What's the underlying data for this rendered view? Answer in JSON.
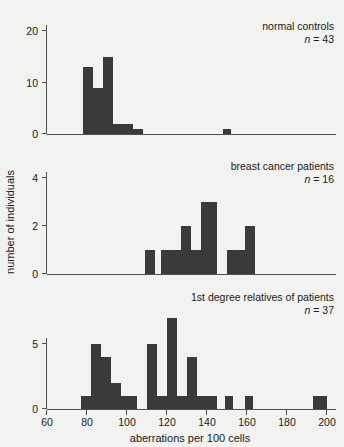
{
  "figure": {
    "background_color": "#f2f2f0",
    "bar_color": "#3a3a3a",
    "axis_color": "#4d4d4d"
  },
  "axis": {
    "xlabel": "aberrations per 100 cells",
    "ylabel": "number of individuals",
    "x_ticks": [
      "60",
      "80",
      "100",
      "120",
      "140",
      "160",
      "180",
      "200"
    ],
    "x_tick_values": [
      60,
      80,
      100,
      120,
      140,
      160,
      180,
      200
    ],
    "xlim": [
      57,
      203
    ]
  },
  "panels": [
    {
      "id": "normal-controls",
      "title": "normal controls",
      "n_label": "n = 43",
      "n_symbol": "n",
      "n_value": "= 43",
      "y_ticks": [
        "0",
        "10",
        "20"
      ],
      "y_tick_values": [
        0,
        10,
        20
      ],
      "ylim": [
        0,
        21
      ]
    },
    {
      "id": "breast-cancer-patients",
      "title": "breast cancer patients",
      "n_label": "n = 16",
      "n_symbol": "n",
      "n_value": "= 16",
      "y_ticks": [
        "0",
        "2",
        "4"
      ],
      "y_tick_values": [
        0,
        2,
        4
      ],
      "ylim": [
        0,
        4.6
      ]
    },
    {
      "id": "first-degree-relatives",
      "title": "1st degree relatives of patients",
      "n_label": "n = 37",
      "n_symbol": "n",
      "n_value": "= 37",
      "y_ticks": [
        "0",
        "5"
      ],
      "y_tick_values": [
        0,
        5
      ],
      "ylim": [
        0,
        7.3
      ]
    }
  ],
  "chart_data": [
    {
      "type": "bar",
      "title": "normal controls",
      "subtitle": "n = 43",
      "xlabel": "aberrations per 100 cells",
      "ylabel": "number of individuals",
      "bin_width": 5,
      "xlim": [
        57,
        203
      ],
      "ylim": [
        0,
        21
      ],
      "grid": false,
      "bins": [
        78,
        83,
        88,
        93,
        98,
        103,
        108,
        148
      ],
      "values": [
        13,
        9,
        15,
        2,
        2,
        1,
        0,
        1
      ],
      "bars": [
        {
          "x0": 78,
          "x1": 83,
          "height": 13
        },
        {
          "x0": 83,
          "x1": 88,
          "height": 9
        },
        {
          "x0": 88,
          "x1": 93,
          "height": 15
        },
        {
          "x0": 93,
          "x1": 98,
          "height": 2
        },
        {
          "x0": 98,
          "x1": 103,
          "height": 2
        },
        {
          "x0": 103,
          "x1": 108,
          "height": 1
        },
        {
          "x0": 148,
          "x1": 152,
          "height": 1
        }
      ]
    },
    {
      "type": "bar",
      "title": "breast cancer patients",
      "subtitle": "n = 16",
      "xlabel": "aberrations per 100 cells",
      "ylabel": "number of individuals",
      "bin_width": 5,
      "xlim": [
        57,
        203
      ],
      "ylim": [
        0,
        4.6
      ],
      "grid": false,
      "bars": [
        {
          "x0": 109,
          "x1": 114,
          "height": 1
        },
        {
          "x0": 117,
          "x1": 122,
          "height": 1
        },
        {
          "x0": 122,
          "x1": 127,
          "height": 1
        },
        {
          "x0": 127,
          "x1": 132,
          "height": 2
        },
        {
          "x0": 132,
          "x1": 137,
          "height": 1
        },
        {
          "x0": 137,
          "x1": 145,
          "height": 3
        },
        {
          "x0": 150,
          "x1": 159,
          "height": 1
        },
        {
          "x0": 159,
          "x1": 164,
          "height": 2
        }
      ]
    },
    {
      "type": "bar",
      "title": "1st degree relatives of patients",
      "subtitle": "n = 37",
      "xlabel": "aberrations per 100 cells",
      "ylabel": "number of individuals",
      "bin_width": 5,
      "xlim": [
        57,
        203
      ],
      "ylim": [
        0,
        7.3
      ],
      "grid": false,
      "bars": [
        {
          "x0": 77,
          "x1": 82,
          "height": 1
        },
        {
          "x0": 82,
          "x1": 87,
          "height": 5
        },
        {
          "x0": 87,
          "x1": 92,
          "height": 4
        },
        {
          "x0": 92,
          "x1": 97,
          "height": 2
        },
        {
          "x0": 97,
          "x1": 105,
          "height": 1
        },
        {
          "x0": 110,
          "x1": 115,
          "height": 5
        },
        {
          "x0": 115,
          "x1": 120,
          "height": 1
        },
        {
          "x0": 120,
          "x1": 125,
          "height": 7
        },
        {
          "x0": 125,
          "x1": 130,
          "height": 1
        },
        {
          "x0": 130,
          "x1": 135,
          "height": 4
        },
        {
          "x0": 135,
          "x1": 145,
          "height": 1
        },
        {
          "x0": 149,
          "x1": 153,
          "height": 1
        },
        {
          "x0": 159,
          "x1": 163,
          "height": 1
        },
        {
          "x0": 193,
          "x1": 200,
          "height": 1
        }
      ]
    }
  ]
}
